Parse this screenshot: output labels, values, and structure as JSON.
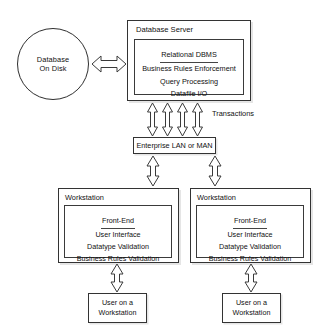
{
  "diagram": {
    "background_color": "#ffffff",
    "line_color": "#333333",
    "text_color": "#111111"
  },
  "database_disk": {
    "line1": "Database",
    "line2": "On Disk"
  },
  "database_server": {
    "title": "Database Server",
    "dbms": {
      "heading": "Relational DBMS",
      "lines": [
        "Business  Rules  Enforcement",
        "Query Processing",
        "Datafile  I/O"
      ]
    }
  },
  "network": {
    "label": "Enterprise LAN or MAN",
    "transactions_label": "Transactions"
  },
  "workstations": [
    {
      "title": "Workstation",
      "front_end": {
        "heading": "Front-End",
        "lines": [
          "User Interface",
          "Datatype  Validation",
          "Business  Rules  Validation"
        ]
      }
    },
    {
      "title": "Workstation",
      "front_end": {
        "heading": "Front-End",
        "lines": [
          "User Interface",
          "Datatype  Validation",
          "Business  Rules  Validation"
        ]
      }
    }
  ],
  "users": [
    {
      "line1": "User on a",
      "line2": "Workstation"
    },
    {
      "line1": "User on a",
      "line2": "Workstation"
    }
  ],
  "connectors": [
    {
      "name": "disk-to-server",
      "direction": "bidirectional",
      "orientation": "horizontal",
      "count": 1
    },
    {
      "name": "server-to-lan",
      "direction": "bidirectional",
      "orientation": "vertical",
      "count": 4
    },
    {
      "name": "lan-to-workstations",
      "direction": "bidirectional",
      "orientation": "vertical",
      "count": 2
    },
    {
      "name": "workstations-to-users",
      "direction": "bidirectional",
      "orientation": "vertical",
      "count": 2
    }
  ]
}
